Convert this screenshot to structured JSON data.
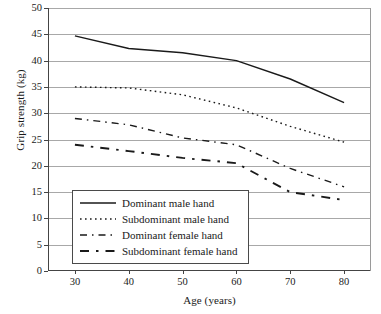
{
  "chart_data": {
    "type": "line",
    "title": "",
    "xlabel": "Age (years)",
    "ylabel": "Grip strength (kg)",
    "xlim": [
      25,
      85
    ],
    "ylim": [
      0,
      50
    ],
    "xticks": [
      30,
      40,
      50,
      60,
      70,
      80
    ],
    "yticks": [
      0,
      5,
      10,
      15,
      20,
      25,
      30,
      35,
      40,
      45,
      50
    ],
    "grid": "horizontal",
    "legend_position": "inside-bottom-left",
    "x": [
      30,
      40,
      50,
      60,
      70,
      80
    ],
    "series": [
      {
        "name": "Dominant male hand",
        "style": "solid",
        "color": "#1a1a1a",
        "values": [
          44.7,
          42.3,
          41.5,
          40.0,
          36.5,
          32.0
        ]
      },
      {
        "name": "Subdominant male hand",
        "style": "dotted",
        "color": "#1a1a1a",
        "values": [
          35.0,
          34.8,
          33.5,
          31.0,
          27.5,
          24.5
        ]
      },
      {
        "name": "Dominant female hand",
        "style": "dashed",
        "color": "#1a1a1a",
        "values": [
          29.0,
          27.8,
          25.3,
          24.0,
          19.5,
          16.0
        ]
      },
      {
        "name": "Subdominant female hand",
        "style": "long-dash",
        "color": "#1a1a1a",
        "values": [
          24.0,
          22.8,
          21.5,
          20.5,
          15.0,
          13.5
        ]
      }
    ]
  },
  "axis": {
    "y_tick_labels": [
      "50",
      "45",
      "40",
      "35",
      "30",
      "25",
      "20",
      "15",
      "10",
      "5",
      "0"
    ],
    "x_tick_labels": [
      "30",
      "40",
      "50",
      "60",
      "70",
      "80"
    ],
    "x_title": "Age (years)",
    "y_title": "Grip strength (kg)"
  },
  "legend": {
    "items": [
      {
        "label": "Dominant male hand"
      },
      {
        "label": "Subdominant male hand"
      },
      {
        "label": "Dominant female hand"
      },
      {
        "label": "Subdominant female hand"
      }
    ]
  }
}
